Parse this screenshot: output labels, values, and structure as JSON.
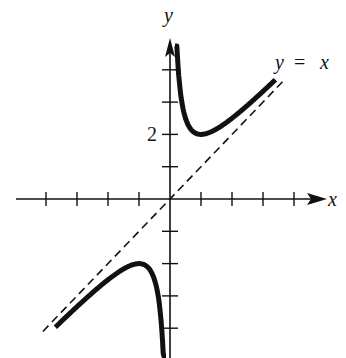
{
  "chart_data": {
    "type": "line",
    "title": "",
    "function": "y = x + 1/x",
    "xlabel": "x",
    "ylabel": "y",
    "xlim": [
      -4.2,
      5
    ],
    "ylim": [
      -4.9,
      5
    ],
    "x_ticks": [
      -4,
      -3,
      -2,
      -1,
      1,
      2,
      3,
      4
    ],
    "y_ticks": [
      -4,
      -3,
      -2,
      -1,
      1,
      2,
      3,
      4
    ],
    "y_tick_labels": [
      {
        "value": 2,
        "label": "2"
      }
    ],
    "grid": false,
    "legend": null,
    "series": [
      {
        "name": "f(x) = x + 1/x (x > 0 branch)",
        "style": "solid-thick",
        "x": [
          0.13,
          0.2,
          0.3,
          0.5,
          0.75,
          1,
          1.5,
          2,
          2.5,
          3,
          3.3
        ],
        "y": [
          7.82,
          5.2,
          3.63,
          2.5,
          2.08,
          2,
          2.17,
          2.5,
          2.9,
          3.33,
          3.6
        ]
      },
      {
        "name": "f(x) = x + 1/x (x < 0 branch)",
        "style": "solid-thick",
        "x": [
          -3.7,
          -3,
          -2.5,
          -2,
          -1.5,
          -1,
          -0.75,
          -0.5,
          -0.3,
          -0.2,
          -0.13
        ],
        "y": [
          -3.97,
          -3.33,
          -2.9,
          -2.5,
          -2.17,
          -2,
          -2.08,
          -2.5,
          -3.63,
          -5.2,
          -7.82
        ]
      },
      {
        "name": "asymptote y = x",
        "style": "dashed",
        "x": [
          -4.1,
          3.7
        ],
        "y": [
          -4.1,
          3.7
        ]
      }
    ],
    "annotations": [
      {
        "text": "y = x",
        "near": [
          3.6,
          4.4
        ]
      },
      {
        "text": "y",
        "position": "top of y-axis"
      },
      {
        "text": "x",
        "position": "right end of x-axis"
      }
    ]
  },
  "labels": {
    "x_axis": "x",
    "y_axis": "y",
    "asymptote_y": "y",
    "asymptote_eq": "=",
    "asymptote_x": "x",
    "tick_two": "2"
  },
  "colors": {
    "ink": "#111111",
    "background": "#ffffff"
  }
}
